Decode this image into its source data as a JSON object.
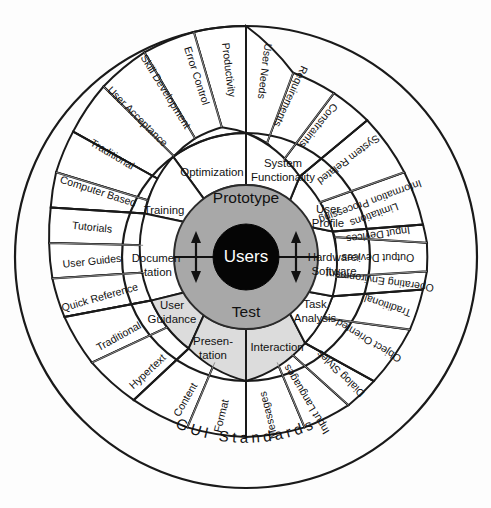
{
  "diagram": {
    "center_label": "Users",
    "core": {
      "top_label": "Prototype",
      "bottom_label": "Test"
    },
    "curved_label": "GUI Standards",
    "colors": {
      "core_ring": "#a8a8a8",
      "center": "#050505",
      "highlight_sector": "#dcdcdc",
      "plain_sector": "#ffffff",
      "stroke": "#1a1a1a"
    },
    "middle_ring": [
      {
        "label": "Optimization",
        "shaded": false
      },
      {
        "label": "System Functionality",
        "shaded": false
      },
      {
        "label": "User Profile",
        "shaded": false
      },
      {
        "label": "Hardware/ Software",
        "shaded": false
      },
      {
        "label": "Task Analysis",
        "shaded": false
      },
      {
        "label": "Interaction",
        "shaded": true
      },
      {
        "label": "Presentation",
        "shaded": true
      },
      {
        "label": "User Guidance",
        "shaded": true
      },
      {
        "label": "Documen -tation",
        "shaded": false
      },
      {
        "label": "Training",
        "shaded": false
      }
    ],
    "middle_ring_labels": {
      "optimization": "Optimization",
      "system_functionality_line1": "System",
      "system_functionality_line2": "Functionality",
      "user_profile_line1": "User",
      "user_profile_line2": "Profile",
      "hardware_software_line1": "Hardware/",
      "hardware_software_line2": "Software",
      "task_analysis_line1": "Task",
      "task_analysis_line2": "Analysis",
      "interaction": "Interaction",
      "presentation_line1": "Presen-",
      "presentation_line2": "tation",
      "user_guidance_line1": "User",
      "user_guidance_line2": "Guidance",
      "documentation_line1": "Documen",
      "documentation_line2": "-tation",
      "training": "Training"
    },
    "outer_ring": [
      {
        "label": "Productivity",
        "parent": "Optimization"
      },
      {
        "label": "Error Control",
        "parent": "Optimization"
      },
      {
        "label": "Skill Development",
        "parent": "Optimization"
      },
      {
        "label": "User Acceptance",
        "parent": "Optimization"
      },
      {
        "label": "User Needs",
        "parent": "System Functionality"
      },
      {
        "label": "Requirements",
        "parent": "System Functionality"
      },
      {
        "label": "Constraints",
        "parent": "System Functionality"
      },
      {
        "label": "System Related",
        "parent": "User Profile"
      },
      {
        "label": "Information Processing Limitations",
        "parent": "User Profile"
      },
      {
        "label": "Input Devices",
        "parent": "Hardware/ Software"
      },
      {
        "label": "Output Devices",
        "parent": "Hardware/ Software"
      },
      {
        "label": "Operating Environment",
        "parent": "Hardware/ Software"
      },
      {
        "label": "Traditional",
        "parent": "Task Analysis"
      },
      {
        "label": "Object Oriented",
        "parent": "Task Analysis"
      },
      {
        "label": "Dialog Styles",
        "parent": "Interaction"
      },
      {
        "label": "Input Languages",
        "parent": "Interaction"
      },
      {
        "label": "Messages",
        "parent": "Interaction"
      },
      {
        "label": "Format",
        "parent": "Presentation"
      },
      {
        "label": "Content",
        "parent": "Presentation"
      },
      {
        "label": "Hypertext",
        "parent": "User Guidance"
      },
      {
        "label": "Traditional",
        "parent": "User Guidance"
      },
      {
        "label": "Quick Reference",
        "parent": "Documen -tation"
      },
      {
        "label": "User Guides",
        "parent": "Documen -tation"
      },
      {
        "label": "Tutorials",
        "parent": "Documen -tation"
      },
      {
        "label": "Computer Based",
        "parent": "Training"
      },
      {
        "label": "Traditional",
        "parent": "Training"
      }
    ],
    "outer_ring_labels": {
      "productivity": "Productivity",
      "error_control": "Error Control",
      "skill_development": "Skill Development",
      "user_acceptance": "User Acceptance",
      "user_needs": "User Needs",
      "requirements": "Requirements",
      "constraints": "Constraints",
      "system_related": "System Related",
      "info_proc_line1": "Information Processing",
      "info_proc_line2": "Limitations",
      "input_devices": "Input Devices",
      "output_devices": "Output Devices",
      "operating_environment": "Operating Environment",
      "task_traditional": "Traditional",
      "object_oriented": "Object Oriented",
      "dialog_styles": "Dialog Styles",
      "input_languages": "Input Languages",
      "messages": "Messages",
      "format": "Format",
      "content": "Content",
      "hypertext": "Hypertext",
      "guidance_traditional": "Traditional",
      "quick_reference": "Quick Reference",
      "user_guides": "User Guides",
      "tutorials": "Tutorials",
      "computer_based": "Computer Based",
      "training_traditional": "Traditional"
    }
  }
}
